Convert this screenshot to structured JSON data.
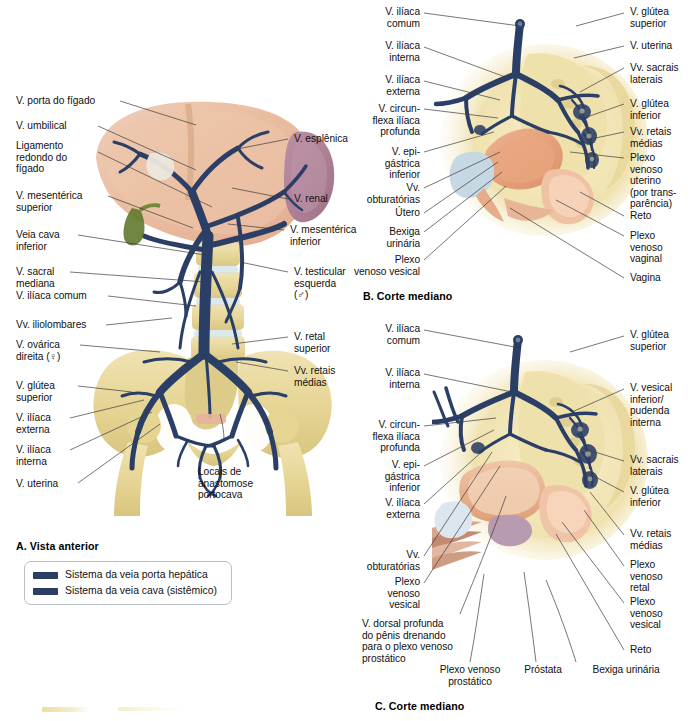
{
  "panels": {
    "a": {
      "title": "A. Vista anterior",
      "labels_left": [
        {
          "id": "v-porta-figado",
          "text": "V. porta do fígado"
        },
        {
          "id": "v-umbilical",
          "text": "V. umbilical"
        },
        {
          "id": "ligamento-redondo",
          "text": "Ligamento\nredondo do\nfígado"
        },
        {
          "id": "v-mesenterica-superior",
          "text": "V. mesentérica\nsuperior"
        },
        {
          "id": "veia-cava-inferior",
          "text": "Veia cava\ninferior"
        },
        {
          "id": "v-sacral-mediana",
          "text": "V. sacral\nmediana"
        },
        {
          "id": "v-iliaca-comum",
          "text": "V. ilíaca comum"
        },
        {
          "id": "vv-iliolombares",
          "text": "Vv. iliolombares"
        },
        {
          "id": "v-ovarica-direita",
          "text": "V. ovárica\ndireita (♀)"
        },
        {
          "id": "v-glutea-superior",
          "text": "V. glútea\nsuperior"
        },
        {
          "id": "v-iliaca-externa",
          "text": "V. ilíaca\nexterna"
        },
        {
          "id": "v-iliaca-interna",
          "text": "V. ilíaca\ninterna"
        },
        {
          "id": "v-uterina",
          "text": "V. uterina"
        }
      ],
      "labels_right": [
        {
          "id": "v-esplenica",
          "text": "V. esplênica"
        },
        {
          "id": "v-renal",
          "text": "V. renal"
        },
        {
          "id": "v-mesenterica-inferior",
          "text": "V. mesentérica\ninferior"
        },
        {
          "id": "v-testicular-esquerda",
          "text": "V. testicular\nesquerda\n(♂)"
        },
        {
          "id": "v-retal-superior",
          "text": "V. retal\nsuperior"
        },
        {
          "id": "vv-retais-medias",
          "text": "Vv. retais\nmédias"
        }
      ],
      "labels_bottom": [
        {
          "id": "locais-anastomose",
          "text": "Locais de\nanastomose\nportocava"
        }
      ],
      "legend": {
        "items": [
          {
            "id": "sistema-porta-hepatica",
            "label": "Sistema da veia porta hepática",
            "color": "#2b3f66"
          },
          {
            "id": "sistema-veia-cava",
            "label": "Sistema da veia cava (sistêmico)",
            "color": "#2b3f66"
          }
        ]
      }
    },
    "b": {
      "title": "B. Corte mediano",
      "labels_left": [
        {
          "id": "b-v-iliaca-comum",
          "text": "V. ilíaca\ncomum"
        },
        {
          "id": "b-v-iliaca-interna",
          "text": "V. ilíaca\ninterna"
        },
        {
          "id": "b-v-iliaca-externa",
          "text": "V. ilíaca\nexterna"
        },
        {
          "id": "b-v-circunflexa-iliaca-profunda",
          "text": "V. circun-\nflexa ilíaca\nprofunda"
        },
        {
          "id": "b-v-epigastrica-inferior",
          "text": "V. epi-\ngástrica\ninferior"
        },
        {
          "id": "b-vv-obturatorias",
          "text": "Vv.\nobturatórias"
        },
        {
          "id": "b-utero",
          "text": "Útero"
        },
        {
          "id": "b-bexiga-urinaria",
          "text": "Bexiga\nurinária"
        },
        {
          "id": "b-plexo-venoso-vesical",
          "text": "Plexo\nvenoso vesical"
        }
      ],
      "labels_right": [
        {
          "id": "b-v-glutea-superior",
          "text": "V. glútea\nsuperior"
        },
        {
          "id": "b-v-uterina",
          "text": "V. uterina"
        },
        {
          "id": "b-vv-sacrais-laterais",
          "text": "Vv. sacrais\nlaterais"
        },
        {
          "id": "b-v-glutea-inferior",
          "text": "V. glútea\ninferior"
        },
        {
          "id": "b-vv-retais-medias",
          "text": "Vv. retais\nmédias"
        },
        {
          "id": "b-plexo-venoso-uterino",
          "text": "Plexo\nvenoso\nuterino\n(por trans-\nparência)"
        },
        {
          "id": "b-reto",
          "text": "Reto"
        },
        {
          "id": "b-plexo-venoso-vaginal",
          "text": "Plexo\nvenoso\nvaginal"
        },
        {
          "id": "b-vagina",
          "text": "Vagina"
        }
      ]
    },
    "c": {
      "title": "C. Corte mediano",
      "labels_left": [
        {
          "id": "c-v-iliaca-comum",
          "text": "V. ilíaca\ncomum"
        },
        {
          "id": "c-v-iliaca-interna",
          "text": "V. ilíaca\ninterna"
        },
        {
          "id": "c-v-circunflexa-iliaca-profunda",
          "text": "V. circun-\nflexa ilíaca\nprofunda"
        },
        {
          "id": "c-v-epigastrica-inferior",
          "text": "V. epi-\ngástrica\ninferior"
        },
        {
          "id": "c-v-iliaca-externa",
          "text": "V. ilíaca\nexterna"
        },
        {
          "id": "c-vv-obturatorias",
          "text": "Vv.\nobturatórias"
        },
        {
          "id": "c-plexo-venoso-vesical",
          "text": "Plexo\nvenoso\nvesical"
        },
        {
          "id": "c-v-dorsal-profunda-penis",
          "text": "V. dorsal profunda\ndo pênis drenando\npara o plexo venoso\nprostático"
        }
      ],
      "labels_right": [
        {
          "id": "c-v-glutea-superior",
          "text": "V. glútea\nsuperior"
        },
        {
          "id": "c-v-vesical-inferior",
          "text": "V. vesical\ninferior/\npudenda\ninterna"
        },
        {
          "id": "c-vv-sacrais-laterais",
          "text": "Vv. sacrais\nlaterais"
        },
        {
          "id": "c-v-glutea-inferior",
          "text": "V. glútea\ninferior"
        },
        {
          "id": "c-vv-retais-medias",
          "text": "Vv. retais\nmédias"
        },
        {
          "id": "c-plexo-venoso-retal",
          "text": "Plexo\nvenoso\nretal"
        },
        {
          "id": "c-plexo-venoso-vesical-2",
          "text": "Plexo\nvenoso\nvesical"
        },
        {
          "id": "c-reto",
          "text": "Reto"
        }
      ],
      "labels_bottom": [
        {
          "id": "c-plexo-venoso-prostatico",
          "text": "Plexo venoso\nprostático"
        },
        {
          "id": "c-prostata",
          "text": "Próstata"
        },
        {
          "id": "c-bexiga-urinaria",
          "text": "Bexiga urinária"
        }
      ]
    }
  },
  "colors": {
    "vein": "#2b3f66",
    "vein_dark": "#22314f",
    "bone": "#e7d79a",
    "bone_light": "#f2e7bf",
    "liver": "#e8b79b",
    "liver_light": "#efc7ae",
    "spleen": "#b0839a",
    "organ": "#e09a74",
    "bladder": "#c6d7e2",
    "leader": "#3c3c3c"
  }
}
